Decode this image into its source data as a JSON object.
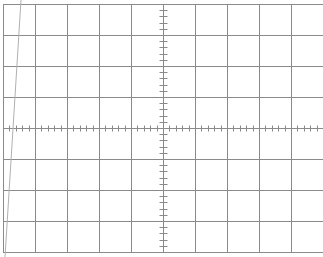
{
  "graticule": {
    "left": 3,
    "top": 4,
    "right": 323,
    "bottom": 252,
    "h_divisions": 10,
    "v_divisions": 8,
    "minor_ticks_per_division": 5,
    "grid_color": "#8a8a8a",
    "axis_color": "#8a8a8a"
  },
  "trace": {
    "color": "#b0b0b0",
    "x1": 21,
    "y1": 0,
    "x2": 5,
    "y2": 257
  }
}
